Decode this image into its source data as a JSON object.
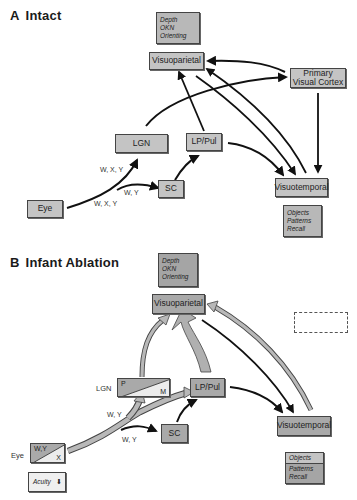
{
  "panels": {
    "a": {
      "letter": "A",
      "title": "Intact",
      "boxes": {
        "visuoparietal": "Visuoparietal",
        "primary_visual_cortex_line1": "Primary",
        "primary_visual_cortex_line2": "Visual Cortex",
        "lgn": "LGN",
        "lp_pul": "LP/Pul",
        "sc": "SC",
        "eye": "Eye",
        "visuotemporal": "Visuotemporal"
      },
      "notes": {
        "parietal_functions": [
          "Depth",
          "OKN",
          "Orienting"
        ],
        "temporal_functions": [
          "Objects",
          "Patterns",
          "Recall"
        ]
      },
      "edge_labels": {
        "to_lgn": "W, X, Y",
        "to_sc": "W, Y",
        "from_eye": "W, X, Y"
      }
    },
    "b": {
      "letter": "B",
      "title": "Infant Ablation",
      "boxes": {
        "visuoparietal": "Visuoparietal",
        "lgn_label": "LGN",
        "lgn_p": "P",
        "lgn_m": "M",
        "lp_pul": "LP/Pul",
        "sc": "SC",
        "eye_label": "Eye",
        "eye_wy": "W,Y",
        "eye_x": "X",
        "visuotemporal": "Visuotemporal"
      },
      "notes": {
        "parietal_functions": [
          "Depth",
          "OKN",
          "Orienting"
        ],
        "temporal_top": "Objects",
        "temporal_bottom": [
          "Patterns",
          "Recall"
        ],
        "acuity": "Acuity",
        "acuity_symbol": "⬇"
      },
      "edge_labels": {
        "to_lgn": "W, Y",
        "to_sc": "W, Y"
      }
    }
  },
  "colors": {
    "box_fill": "#c4c4c4",
    "box_dark_fill": "#a9a9a9",
    "arrow_black": "#111111",
    "arrow_gray": "#b0b0b0"
  }
}
